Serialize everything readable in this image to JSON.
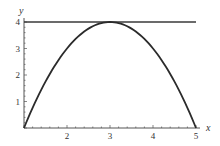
{
  "chart_data": {
    "type": "line",
    "title": "",
    "xlabel": "x",
    "ylabel": "y",
    "xlim": [
      1,
      5
    ],
    "ylim": [
      0,
      4
    ],
    "x_ticks": [
      "2",
      "3",
      "4",
      "5"
    ],
    "y_ticks": [
      "1",
      "2",
      "3",
      "4"
    ],
    "grid": false,
    "legend": null,
    "series": [
      {
        "name": "parabola",
        "description": "y = 4 - (x - 3)^2",
        "x": [
          1,
          1.5,
          2,
          2.5,
          3,
          3.5,
          4,
          4.5,
          5
        ],
        "values": [
          0,
          1.75,
          3,
          3.75,
          4,
          3.75,
          3,
          1.75,
          0
        ],
        "color": "#2b2b2b"
      },
      {
        "name": "horizontal-line",
        "description": "y = 4",
        "x": [
          1,
          5
        ],
        "values": [
          4,
          4
        ],
        "color": "#3a3a3a"
      }
    ]
  },
  "colors": {
    "axis": "#555555",
    "curve": "#2b2b2b",
    "line": "#3a3a3a"
  }
}
